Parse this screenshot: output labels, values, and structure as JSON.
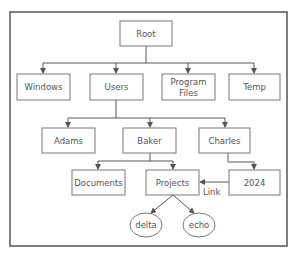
{
  "diagram": {
    "type": "directory-tree",
    "nodes": {
      "root": {
        "label": "Root"
      },
      "windows": {
        "label": "Windows"
      },
      "users": {
        "label": "Users"
      },
      "program_files": {
        "label_line1": "Program",
        "label_line2": "Files"
      },
      "temp": {
        "label": "Temp"
      },
      "adams": {
        "label": "Adams"
      },
      "baker": {
        "label": "Baker"
      },
      "charles": {
        "label": "Charles"
      },
      "documents": {
        "label": "Documents"
      },
      "projects": {
        "label": "Projects"
      },
      "y2024": {
        "label": "2024"
      },
      "delta": {
        "label": "delta"
      },
      "echo": {
        "label": "echo"
      }
    },
    "edges": [
      {
        "from": "Root",
        "to": "Windows"
      },
      {
        "from": "Root",
        "to": "Users"
      },
      {
        "from": "Root",
        "to": "Program Files"
      },
      {
        "from": "Root",
        "to": "Temp"
      },
      {
        "from": "Users",
        "to": "Adams"
      },
      {
        "from": "Users",
        "to": "Baker"
      },
      {
        "from": "Users",
        "to": "Charles"
      },
      {
        "from": "Baker",
        "to": "Documents"
      },
      {
        "from": "Baker",
        "to": "Projects"
      },
      {
        "from": "Charles",
        "to": "2024"
      },
      {
        "from": "2024",
        "to": "Projects",
        "label": "Link"
      },
      {
        "from": "Projects",
        "to": "delta"
      },
      {
        "from": "Projects",
        "to": "echo"
      }
    ],
    "link_label": "Link"
  }
}
